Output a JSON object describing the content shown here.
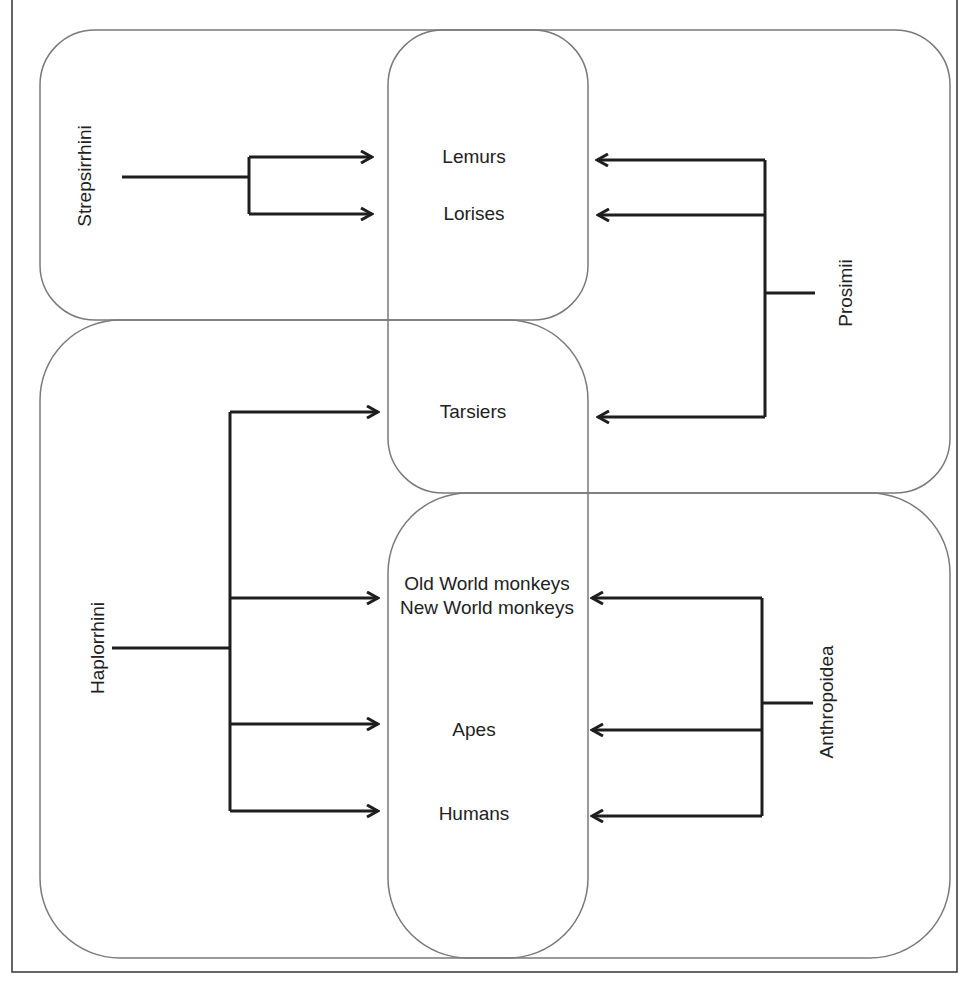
{
  "diagram": {
    "type": "primate-classification-overlap",
    "groups": [
      {
        "id": "strepsirrhini",
        "label": "Strepsirrhini",
        "members": [
          "Lemurs",
          "Lorises"
        ]
      },
      {
        "id": "prosimii",
        "label": "Prosimii",
        "members": [
          "Lemurs",
          "Lorises",
          "Tarsiers"
        ]
      },
      {
        "id": "haplorrhini",
        "label": "Haplorrhini",
        "members": [
          "Tarsiers",
          "Old World monkeys / New World monkeys",
          "Apes",
          "Humans"
        ]
      },
      {
        "id": "anthropoidea",
        "label": "Anthropoidea",
        "members": [
          "Old World monkeys / New World monkeys",
          "Apes",
          "Humans"
        ]
      }
    ],
    "taxa": {
      "lemurs": "Lemurs",
      "lorises": "Lorises",
      "tarsiers": "Tarsiers",
      "old_world_monkeys": "Old World monkeys",
      "new_world_monkeys": "New World monkeys",
      "apes": "Apes",
      "humans": "Humans"
    },
    "colors": {
      "outline": "#7a7a7a",
      "arrows": "#1e1e1e",
      "text": "#222222"
    }
  }
}
